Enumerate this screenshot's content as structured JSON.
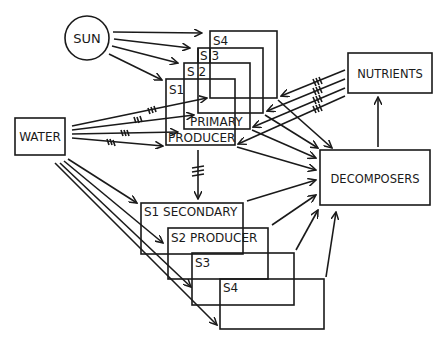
{
  "diagram": {
    "type": "ecosystem flow diagram",
    "nodes": {
      "sun": {
        "label": "SUN"
      },
      "water": {
        "label": "WATER"
      },
      "nutrients": {
        "label": "NUTRIENTS"
      },
      "decomposers": {
        "label": "DECOMPOSERS"
      },
      "primary_producer": {
        "label_line1": "PRIMARY",
        "label_line2": "PRODUCER",
        "stages": [
          "S1",
          "S 2",
          "S 3",
          "S4"
        ]
      },
      "secondary_producer": {
        "stage_labels": [
          "S1 SECONDARY",
          "S2 PRODUCER",
          "S3",
          "S4"
        ]
      }
    },
    "edges": [
      {
        "from": "SUN",
        "to": "PRIMARY PRODUCER S4"
      },
      {
        "from": "SUN",
        "to": "PRIMARY PRODUCER S3"
      },
      {
        "from": "SUN",
        "to": "PRIMARY PRODUCER S2"
      },
      {
        "from": "SUN",
        "to": "PRIMARY PRODUCER S1"
      },
      {
        "from": "WATER",
        "to": "PRIMARY PRODUCER S4",
        "hatched": true
      },
      {
        "from": "WATER",
        "to": "PRIMARY PRODUCER S3",
        "hatched": true
      },
      {
        "from": "WATER",
        "to": "PRIMARY PRODUCER S2",
        "hatched": true
      },
      {
        "from": "WATER",
        "to": "PRIMARY PRODUCER S1",
        "hatched": true
      },
      {
        "from": "NUTRIENTS",
        "to": "PRIMARY PRODUCER S4",
        "hatched": true
      },
      {
        "from": "NUTRIENTS",
        "to": "PRIMARY PRODUCER S3",
        "hatched": true
      },
      {
        "from": "NUTRIENTS",
        "to": "PRIMARY PRODUCER S2",
        "hatched": true
      },
      {
        "from": "NUTRIENTS",
        "to": "PRIMARY PRODUCER S1",
        "hatched": true
      },
      {
        "from": "PRIMARY PRODUCER",
        "to": "SECONDARY PRODUCER",
        "hatched": true
      },
      {
        "from": "WATER",
        "to": "SECONDARY PRODUCER S1"
      },
      {
        "from": "WATER",
        "to": "SECONDARY PRODUCER S2"
      },
      {
        "from": "WATER",
        "to": "SECONDARY PRODUCER S3"
      },
      {
        "from": "WATER",
        "to": "SECONDARY PRODUCER S4"
      },
      {
        "from": "PRIMARY PRODUCER S1-S4",
        "to": "DECOMPOSERS"
      },
      {
        "from": "SECONDARY PRODUCER S1-S4",
        "to": "DECOMPOSERS"
      },
      {
        "from": "DECOMPOSERS",
        "to": "NUTRIENTS"
      }
    ]
  }
}
